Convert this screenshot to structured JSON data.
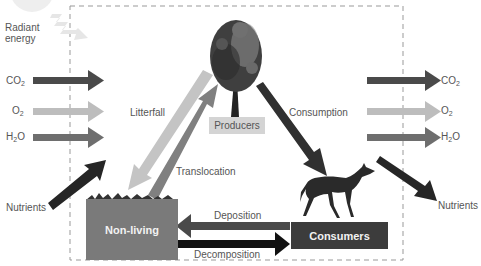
{
  "diagram": {
    "inputs": {
      "radiant_energy": "Radiant\nenergy",
      "radiant_line1": "Radiant",
      "radiant_line2": "energy",
      "co2": {
        "main": "CO",
        "sub": "2"
      },
      "o2": {
        "main": "O",
        "sub": "2"
      },
      "h2o": {
        "pre": "H",
        "sub": "2",
        "post": "O"
      },
      "nutrients": "Nutrients"
    },
    "outputs": {
      "co2": {
        "main": "CO",
        "sub": "2"
      },
      "o2": {
        "main": "O",
        "sub": "2"
      },
      "h2o": {
        "pre": "H",
        "sub": "2",
        "post": "O"
      },
      "nutrients": "Nutrients"
    },
    "compartments": {
      "producers": "Producers",
      "non_living": "Non-living",
      "consumers": "Consumers"
    },
    "flows": {
      "litterfall": "Litterfall",
      "translocation": "Translocation",
      "consumption": "Consumption",
      "deposition": "Deposition",
      "decomposition": "Decomposition"
    },
    "colors": {
      "co2_arrow": "#4a4a4a",
      "o2_arrow": "#bdbdbd",
      "h2o_arrow": "#6e6e6e",
      "nutrients_arrow": "#262626",
      "non_living_box": "#7a7a7a",
      "consumers_box": "#3c3c3c",
      "producers_box": "#d4d4d4",
      "litterfall_arrow": "#c4c4c4",
      "translocation_arrow": "#808080",
      "boundary": "#999999"
    }
  }
}
